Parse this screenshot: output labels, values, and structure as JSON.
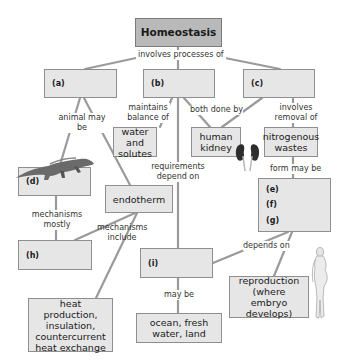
{
  "concept_map": {
    "root": "Homeostasis",
    "nodes": {
      "a": "(a)",
      "b": "(b)",
      "c": "(c)",
      "d": "(d)",
      "e": "(e)",
      "f": "(f)",
      "g": "(g)",
      "h": "(h)",
      "i": "(i)",
      "water": "water and solutes",
      "kidney": "human kidney",
      "nitro": "nitrogenous wastes",
      "endotherm": "endotherm",
      "heat": "heat production, insulation, countercurrent heat exchange",
      "ocean": "ocean, fresh water, land",
      "repro": "reproduction (where embryo develops)"
    },
    "links": {
      "involves_processes_of": "involves processes of",
      "animal_may_be": "animal may be",
      "maintains_balance_of": "maintains balance of",
      "both_done_by": "both done by",
      "involves_removal_of": "involves removal of",
      "requirements_depend_on": "requirements depend on",
      "form_may_be": "form may be",
      "mechanisms_mostly": "mechanisms mostly",
      "mechanisms_include": "mechanisms include",
      "depends_on": "depends on",
      "may_be": "may be"
    },
    "illustrations": [
      "lizard-illustration",
      "kidneys-illustration",
      "pregnant-woman-illustration"
    ]
  }
}
